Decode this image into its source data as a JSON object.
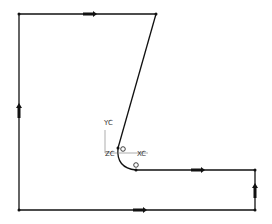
{
  "diagram": {
    "type": "cad-sketch-profile",
    "colors": {
      "line": "#111111",
      "axis": "#555555",
      "background": "#ffffff"
    },
    "csys_labels": {
      "y": "YC",
      "x": "XC",
      "z": "ZC"
    },
    "vertices": [
      {
        "name": "top-left",
        "x": 19,
        "y": 14
      },
      {
        "name": "top-right",
        "x": 156,
        "y": 14
      },
      {
        "name": "slant-bottom",
        "x": 118,
        "y": 148
      },
      {
        "name": "arc-end",
        "x": 136,
        "y": 170
      },
      {
        "name": "right-top",
        "x": 255,
        "y": 170
      },
      {
        "name": "right-bottom",
        "x": 255,
        "y": 210
      },
      {
        "name": "bottom-left",
        "x": 19,
        "y": 210
      }
    ]
  }
}
